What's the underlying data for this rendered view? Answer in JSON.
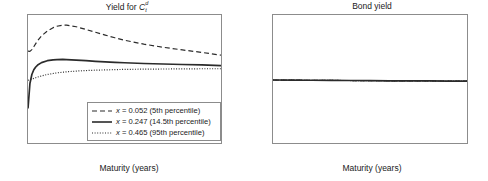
{
  "figure": {
    "background": "#ffffff",
    "axis_color": "#8c8c8c",
    "line_color": "#2b2b2b"
  },
  "panels": [
    {
      "id": "yield-for-c",
      "title_prefix": "Yield for ",
      "title_var": "C",
      "title_sup": "d",
      "title_sub": "t",
      "xlabel": "Maturity (years)",
      "ylabel": "",
      "xticks": [
        "0",
        "10",
        "20",
        "30",
        "40",
        "50",
        "60",
        "70",
        "80",
        "90",
        "100"
      ],
      "yticks": [
        "0",
        "0.02",
        "0.04",
        "0.06",
        "0.08",
        "0.1"
      ]
    },
    {
      "id": "bond-yield",
      "title": "Bond yield",
      "xlabel": "Maturity (years)",
      "ylabel": "",
      "xticks": [
        "0",
        "10",
        "20",
        "30",
        "40",
        "50",
        "60",
        "70",
        "80",
        "90",
        "100"
      ],
      "yticks": [
        "0",
        "0.02",
        "0.04",
        "0.06",
        "0.08",
        "0.1"
      ]
    }
  ],
  "legend": {
    "entries": [
      {
        "style": "dashed",
        "var": "x",
        "eq": " = 0.052 (5th percentile)"
      },
      {
        "style": "solid",
        "var": "x",
        "eq": " = 0.247 (14.5th percentile)"
      },
      {
        "style": "dotted",
        "var": "x",
        "eq": " = 0.465 (95th percentile)"
      }
    ]
  },
  "chart_data": [
    {
      "type": "line",
      "title": "Yield for C_t^d",
      "xlabel": "Maturity (years)",
      "ylabel": "",
      "xlim": [
        0,
        100
      ],
      "ylim": [
        0,
        0.1
      ],
      "xticks": [
        0,
        10,
        20,
        30,
        40,
        50,
        60,
        70,
        80,
        90,
        100
      ],
      "yticks": [
        0,
        0.02,
        0.04,
        0.06,
        0.08,
        0.1
      ],
      "grid": false,
      "legend_position": "lower right",
      "x": [
        0,
        1,
        2,
        3,
        4,
        5,
        7,
        10,
        13,
        15,
        18,
        20,
        25,
        30,
        35,
        40,
        45,
        50,
        60,
        70,
        80,
        90,
        100
      ],
      "series": [
        {
          "name": "x = 0.052 (5th percentile)",
          "style": "dashed",
          "values": [
            0.0718,
            0.0716,
            0.073,
            0.0752,
            0.0776,
            0.0799,
            0.0837,
            0.0875,
            0.0901,
            0.0912,
            0.0921,
            0.0921,
            0.0908,
            0.0887,
            0.0865,
            0.0843,
            0.0822,
            0.0803,
            0.0772,
            0.0748,
            0.0727,
            0.0708,
            0.0686
          ]
        },
        {
          "name": "x = 0.247 (14.5th percentile)",
          "style": "solid",
          "values": [
            0.027,
            0.0465,
            0.0535,
            0.0572,
            0.0594,
            0.0609,
            0.0628,
            0.0643,
            0.065,
            0.0652,
            0.0653,
            0.0652,
            0.0648,
            0.0643,
            0.0638,
            0.0634,
            0.063,
            0.0627,
            0.0621,
            0.0617,
            0.0613,
            0.061,
            0.0605
          ]
        },
        {
          "name": "x = 0.465 (95th percentile)",
          "style": "dotted",
          "values": [
            0.049,
            0.0494,
            0.0499,
            0.0505,
            0.051,
            0.0515,
            0.0524,
            0.0535,
            0.0543,
            0.0548,
            0.0553,
            0.0556,
            0.0562,
            0.0566,
            0.0569,
            0.0571,
            0.0573,
            0.0575,
            0.0577,
            0.0578,
            0.0579,
            0.058,
            0.058
          ]
        }
      ]
    },
    {
      "type": "line",
      "title": "Bond yield",
      "xlabel": "Maturity (years)",
      "ylabel": "",
      "xlim": [
        0,
        100
      ],
      "ylim": [
        0,
        0.1
      ],
      "xticks": [
        0,
        10,
        20,
        30,
        40,
        50,
        60,
        70,
        80,
        90,
        100
      ],
      "yticks": [
        0,
        0.02,
        0.04,
        0.06,
        0.08,
        0.1
      ],
      "grid": false,
      "legend_position": "none",
      "x": [
        0,
        10,
        20,
        30,
        40,
        50,
        60,
        70,
        80,
        90,
        100
      ],
      "series": [
        {
          "name": "x = 0.052 (5th percentile)",
          "style": "dashed",
          "values": [
            0.0492,
            0.0491,
            0.049,
            0.0489,
            0.0488,
            0.0487,
            0.0486,
            0.0486,
            0.0485,
            0.0484,
            0.0484
          ]
        },
        {
          "name": "x = 0.247 (14.5th percentile)",
          "style": "solid",
          "values": [
            0.0492,
            0.0491,
            0.049,
            0.0489,
            0.0488,
            0.0487,
            0.0486,
            0.0486,
            0.0485,
            0.0484,
            0.0484
          ]
        },
        {
          "name": "x = 0.465 (95th percentile)",
          "style": "dotted",
          "values": [
            0.0492,
            0.0491,
            0.049,
            0.0489,
            0.0488,
            0.0487,
            0.0486,
            0.0486,
            0.0485,
            0.0484,
            0.0484
          ]
        }
      ]
    }
  ]
}
